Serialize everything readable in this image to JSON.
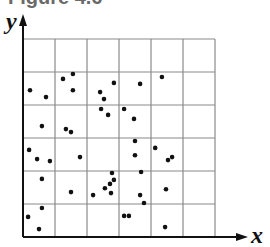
{
  "title": "Figure 4.6",
  "chart_data": {
    "type": "scatter",
    "title": "",
    "xlabel": "x",
    "ylabel": "y",
    "xlim": [
      0,
      6
    ],
    "ylim": [
      0,
      6
    ],
    "grid": true,
    "grid_cells": {
      "cols": 6,
      "rows": 6
    },
    "tick_labels": false,
    "legend": null,
    "marker_color": "#111111",
    "grid_color": "#8a8a8a",
    "axis_color": "#111111",
    "points": [
      [
        0.22,
        4.45
      ],
      [
        0.72,
        4.24
      ],
      [
        1.25,
        4.79
      ],
      [
        1.56,
        4.94
      ],
      [
        1.56,
        4.45
      ],
      [
        2.41,
        4.39
      ],
      [
        2.53,
        4.18
      ],
      [
        2.84,
        4.67
      ],
      [
        3.66,
        4.64
      ],
      [
        4.34,
        4.85
      ],
      [
        2.44,
        3.88
      ],
      [
        2.66,
        3.7
      ],
      [
        3.16,
        3.88
      ],
      [
        3.47,
        3.58
      ],
      [
        0.59,
        3.36
      ],
      [
        1.34,
        3.27
      ],
      [
        1.5,
        3.18
      ],
      [
        0.19,
        2.64
      ],
      [
        0.44,
        2.36
      ],
      [
        0.84,
        2.3
      ],
      [
        1.78,
        2.42
      ],
      [
        3.5,
        2.91
      ],
      [
        3.5,
        2.48
      ],
      [
        4.13,
        2.7
      ],
      [
        4.53,
        2.33
      ],
      [
        4.66,
        2.42
      ],
      [
        2.78,
        1.94
      ],
      [
        2.84,
        1.73
      ],
      [
        2.56,
        1.48
      ],
      [
        2.72,
        1.61
      ],
      [
        2.75,
        1.33
      ],
      [
        2.19,
        1.27
      ],
      [
        3.69,
        1.97
      ],
      [
        3.66,
        1.27
      ],
      [
        3.78,
        1.03
      ],
      [
        4.47,
        1.45
      ],
      [
        0.59,
        1.76
      ],
      [
        1.5,
        1.36
      ],
      [
        0.59,
        0.88
      ],
      [
        0.16,
        0.61
      ],
      [
        0.5,
        0.24
      ],
      [
        3.16,
        0.64
      ],
      [
        3.31,
        0.64
      ],
      [
        4.44,
        0.3
      ]
    ]
  }
}
